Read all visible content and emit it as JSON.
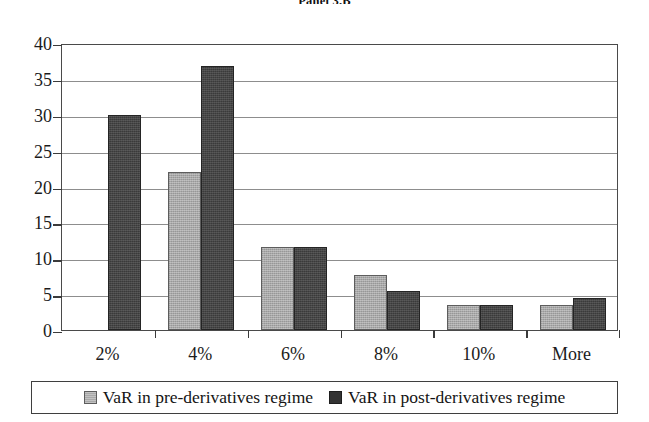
{
  "chart_data": {
    "type": "bar",
    "title": "Panel 3.B",
    "xlabel": "",
    "ylabel": "",
    "categories": [
      "2%",
      "4%",
      "6%",
      "8%",
      "10%",
      "More"
    ],
    "series": [
      {
        "name": "VaR in pre-derivatives regime",
        "color": "#a8a8a8",
        "values": [
          0,
          22.0,
          11.6,
          7.6,
          3.5,
          3.5
        ]
      },
      {
        "name": "VaR in post-derivatives regime",
        "color": "#3a3a3a",
        "values": [
          30.0,
          36.8,
          11.6,
          5.5,
          3.5,
          4.5
        ]
      }
    ],
    "ylim": [
      0,
      40
    ],
    "ytick_labels": [
      "0",
      "5",
      "10",
      "15",
      "20",
      "25",
      "30",
      "35",
      "40"
    ],
    "ytick_values": [
      0,
      5,
      10,
      15,
      20,
      25,
      30,
      35,
      40
    ],
    "grid": true,
    "legend_position": "bottom"
  },
  "legend": {
    "items": [
      {
        "label": "VaR in pre-derivatives regime",
        "swatch": "light"
      },
      {
        "label": "VaR in post-derivatives regime",
        "swatch": "dark"
      }
    ]
  }
}
